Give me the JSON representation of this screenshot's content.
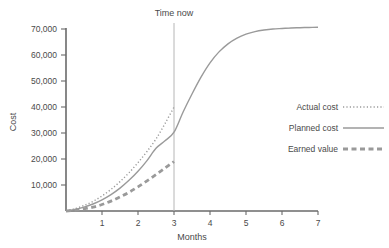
{
  "chart_data": {
    "type": "line",
    "title": "",
    "xlabel": "Months",
    "ylabel": "Cost",
    "xlim": [
      0,
      7
    ],
    "ylim": [
      0,
      70000
    ],
    "grid": false,
    "legend_position": "right",
    "x_ticks": [
      "1",
      "2",
      "3",
      "4",
      "5",
      "6",
      "7"
    ],
    "x_tick_values": [
      1,
      2,
      3,
      4,
      5,
      6,
      7
    ],
    "y_ticks": [
      "10,000",
      "20,000",
      "30,000",
      "40,000",
      "50,000",
      "60,000",
      "70,000"
    ],
    "y_tick_values": [
      10000,
      20000,
      30000,
      40000,
      50000,
      60000,
      70000
    ],
    "annotations": [
      {
        "label": "Time now",
        "x": 3,
        "style": "vertical-line"
      }
    ],
    "series": [
      {
        "name": "Actual cost",
        "style": "dotted",
        "color": "#9a9a9a",
        "width": 1.4,
        "x": [
          0,
          0.25,
          0.5,
          0.75,
          1,
          1.25,
          1.5,
          1.75,
          2,
          2.25,
          2.5,
          2.75,
          3
        ],
        "values": [
          0,
          900,
          2100,
          3700,
          5800,
          8300,
          11300,
          14700,
          18600,
          22900,
          27700,
          33600,
          40000
        ]
      },
      {
        "name": "Planned cost",
        "style": "solid",
        "color": "#9a9a9a",
        "width": 1.4,
        "x": [
          0,
          0.25,
          0.5,
          0.75,
          1,
          1.25,
          1.5,
          1.75,
          2,
          2.25,
          2.5,
          2.75,
          3,
          3.25,
          3.5,
          3.75,
          4,
          4.25,
          4.5,
          4.75,
          5,
          5.25,
          5.5,
          5.75,
          6,
          6.25,
          6.5,
          6.75,
          7
        ],
        "values": [
          0,
          600,
          1500,
          2700,
          4300,
          6300,
          8800,
          11800,
          15300,
          19400,
          24100,
          27000,
          30300,
          38000,
          45000,
          51500,
          57000,
          61200,
          64300,
          66500,
          68000,
          69000,
          69600,
          70000,
          70200,
          70400,
          70500,
          70600,
          70700
        ]
      },
      {
        "name": "Earned value",
        "style": "dashed",
        "color": "#9a9a9a",
        "width": 2.8,
        "x": [
          0,
          0.25,
          0.5,
          0.75,
          1,
          1.25,
          1.5,
          1.75,
          2,
          2.25,
          2.5,
          2.75,
          3
        ],
        "values": [
          0,
          300,
          800,
          1500,
          2500,
          3800,
          5400,
          7200,
          9300,
          11600,
          14000,
          16500,
          19000
        ]
      }
    ]
  },
  "legend": {
    "items": [
      {
        "label": "Actual cost",
        "style": "dotted"
      },
      {
        "label": "Planned cost",
        "style": "solid"
      },
      {
        "label": "Earned value",
        "style": "dashed"
      }
    ]
  },
  "colors": {
    "axis": "#6a6a6a",
    "series": "#9a9a9a",
    "vline": "#b6b6b6",
    "text": "#4a4a4a",
    "background": "#ffffff"
  }
}
